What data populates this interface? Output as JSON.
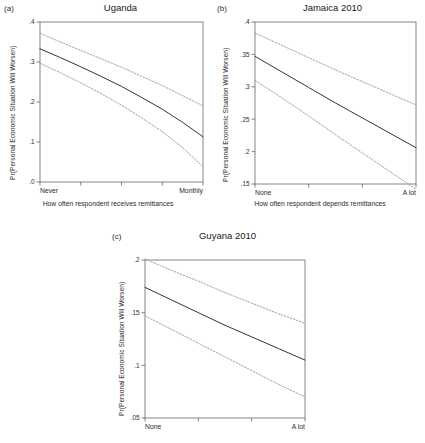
{
  "figure": {
    "shared_ylabel": "Pr(Personal Economic Situation Will Worsen)",
    "line_color": "#333333",
    "ci_color": "#9a9a9a",
    "axis_color": "#666666"
  },
  "panels": [
    {
      "key": "a",
      "label": "(a)",
      "title": "Uganda",
      "ylabel": "Pr(Personal Economic Situation Will Worsen)",
      "xtitle": "How often respondent receives remittances",
      "xcat_left": "Never",
      "xcat_right": "Monthly"
    },
    {
      "key": "b",
      "label": "(b)",
      "title": "Jamaica 2010",
      "ylabel": "Pr(Personal Economic Situation Will Worsen)",
      "xtitle": "How often respondent depends remittances",
      "xcat_left": "None",
      "xcat_right": "A lot"
    },
    {
      "key": "c",
      "label": "(c)",
      "title": "Guyana 2010",
      "ylabel": "Pr(Personal Economic Situation Will Worsen)",
      "xtitle": "",
      "xcat_left": "None",
      "xcat_right": "A lot"
    }
  ],
  "chart_data": [
    {
      "type": "line",
      "panel": "a",
      "title": "Uganda",
      "xlabel": "How often respondent receives remittances",
      "ylabel": "Pr(Personal Economic Situation Will Worsen)",
      "xlim": [
        0,
        4
      ],
      "ylim": [
        0.0,
        0.4
      ],
      "yticks": [
        0.0,
        0.1,
        0.2,
        0.3,
        0.4
      ],
      "ytick_labels": [
        ".0",
        ".1",
        ".2",
        ".3",
        ".4"
      ],
      "xticks": [
        0,
        1,
        2,
        3,
        4
      ],
      "xtick_labels": [
        "Never",
        "",
        "",
        "",
        "Monthly"
      ],
      "grid": false,
      "legend": "none",
      "x": [
        0,
        0.5,
        1,
        1.5,
        2,
        2.5,
        3,
        3.5,
        4
      ],
      "series": [
        {
          "name": "Predicted probability",
          "style": "solid",
          "values": [
            0.333,
            0.311,
            0.288,
            0.264,
            0.239,
            0.211,
            0.182,
            0.149,
            0.113
          ]
        },
        {
          "name": "Upper 95% CI",
          "style": "dotted",
          "values": [
            0.372,
            0.35,
            0.329,
            0.308,
            0.287,
            0.264,
            0.241,
            0.216,
            0.19
          ]
        },
        {
          "name": "Lower 95% CI",
          "style": "dotted",
          "values": [
            0.297,
            0.273,
            0.248,
            0.221,
            0.192,
            0.16,
            0.126,
            0.086,
            0.038
          ]
        }
      ]
    },
    {
      "type": "line",
      "panel": "b",
      "title": "Jamaica 2010",
      "xlabel": "How often respondent depends remittances",
      "ylabel": "Pr(Personal Economic Situation Will Worsen)",
      "xlim": [
        0,
        3
      ],
      "ylim": [
        0.15,
        0.4
      ],
      "yticks": [
        0.15,
        0.2,
        0.25,
        0.3,
        0.35,
        0.4
      ],
      "ytick_labels": [
        ".15",
        ".2",
        ".25",
        ".3",
        ".35",
        ".4"
      ],
      "xticks": [
        0,
        1,
        2,
        3
      ],
      "xtick_labels": [
        "None",
        "",
        "",
        "A lot"
      ],
      "grid": false,
      "legend": "none",
      "x": [
        0,
        0.5,
        1,
        1.5,
        2,
        2.5,
        3
      ],
      "series": [
        {
          "name": "Predicted probability",
          "style": "solid",
          "values": [
            0.347,
            0.323,
            0.299,
            0.275,
            0.252,
            0.229,
            0.206
          ]
        },
        {
          "name": "Upper 95% CI",
          "style": "dotted",
          "values": [
            0.383,
            0.364,
            0.345,
            0.326,
            0.308,
            0.29,
            0.272
          ]
        },
        {
          "name": "Lower 95% CI",
          "style": "dotted",
          "values": [
            0.31,
            0.283,
            0.255,
            0.226,
            0.198,
            0.17,
            0.142
          ]
        }
      ]
    },
    {
      "type": "line",
      "panel": "c",
      "title": "Guyana 2010",
      "xlabel": "",
      "ylabel": "Pr(Personal Economic Situation Will Worsen)",
      "xlim": [
        0,
        3
      ],
      "ylim": [
        0.05,
        0.2
      ],
      "yticks": [
        0.05,
        0.1,
        0.15,
        0.2
      ],
      "ytick_labels": [
        ".05",
        ".1",
        ".15",
        ".2"
      ],
      "xticks": [
        0,
        1,
        2,
        3
      ],
      "xtick_labels": [
        "None",
        "",
        "",
        "A lot"
      ],
      "grid": false,
      "legend": "none",
      "x": [
        0,
        0.5,
        1,
        1.5,
        2,
        2.5,
        3
      ],
      "series": [
        {
          "name": "Predicted probability",
          "style": "solid",
          "values": [
            0.174,
            0.162,
            0.15,
            0.138,
            0.127,
            0.116,
            0.105
          ]
        },
        {
          "name": "Upper 95% CI",
          "style": "dotted",
          "values": [
            0.201,
            0.19,
            0.18,
            0.169,
            0.159,
            0.149,
            0.14
          ]
        },
        {
          "name": "Lower 95% CI",
          "style": "dotted",
          "values": [
            0.147,
            0.134,
            0.121,
            0.108,
            0.095,
            0.082,
            0.07
          ]
        }
      ]
    }
  ]
}
